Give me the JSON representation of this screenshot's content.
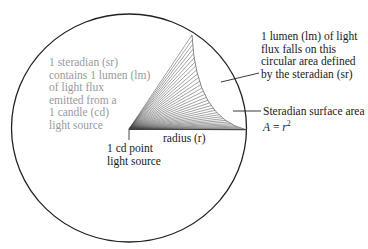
{
  "diagram": {
    "sphere": {
      "cx": 129,
      "cy": 128,
      "rx": 117.5,
      "ry": 114,
      "stroke": "#222222"
    },
    "cone": {
      "apex": [
        129,
        129
      ],
      "top": [
        192,
        35
      ],
      "bottom": [
        247,
        130
      ],
      "line_count": 34,
      "line_color": "#444444"
    },
    "labels": {
      "steradian_desc": [
        "1 steradian (sr)",
        "contains 1 lumen (lm)",
        "of light flux",
        "emitted from a",
        "1 candle (cd)",
        "light source"
      ],
      "lumen_desc": [
        "1 lumen (lm) of light",
        "flux falls on this",
        "circular area defined",
        "by the steradian (sr)"
      ],
      "surface_area": "Steradian surface area",
      "formula_lhs": "A",
      "formula_eq": " = ",
      "formula_r": "r",
      "formula_exp": "2",
      "radius": "radius (r)",
      "point_source": [
        "1 cd point",
        "light source"
      ]
    },
    "colors": {
      "text": "#1a1a1a",
      "gray_text": "#9a9a9a",
      "lines": "#222222"
    }
  }
}
